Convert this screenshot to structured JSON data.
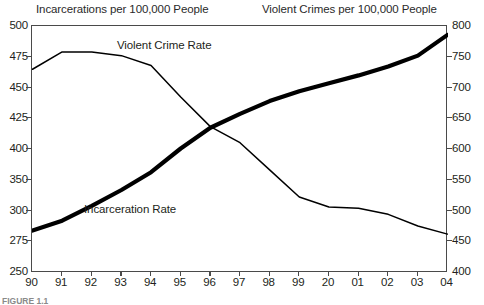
{
  "figure": {
    "left_axis_title": "Incarcerations per 100,000 People",
    "right_axis_title": "Violent Crimes per 100,000 People",
    "caption": "FIGURE 1.1"
  },
  "chart_data": {
    "type": "line",
    "title": "",
    "xlabel": "",
    "grid": false,
    "legend_position": "inline-annotations",
    "x": [
      "90",
      "91",
      "92",
      "93",
      "94",
      "95",
      "96",
      "97",
      "98",
      "99",
      "20",
      "01",
      "02",
      "03",
      "04"
    ],
    "x_tick_labels": [
      "90",
      "91",
      "92",
      "93",
      "94",
      "95",
      "96",
      "97",
      "98",
      "99",
      "20",
      "01",
      "02",
      "03",
      "04"
    ],
    "axes": [
      {
        "id": "left",
        "name": "Incarcerations per 100,000 People",
        "side": "left",
        "ylim": [
          250,
          500
        ],
        "tick_labels": [
          "500",
          "475",
          "450",
          "425",
          "400",
          "350",
          "300",
          "275",
          "250"
        ]
      },
      {
        "id": "right",
        "name": "Violent Crimes per 100,000 People",
        "side": "right",
        "ylim": [
          400,
          800
        ],
        "tick_labels": [
          "800",
          "750",
          "700",
          "650",
          "600",
          "550",
          "500",
          "450",
          "400"
        ]
      }
    ],
    "series": [
      {
        "name": "Incarceration Rate",
        "axis": "left",
        "style": "thick",
        "color": "#000000",
        "label": "Incarceration Rate",
        "values": [
          293,
          303,
          318,
          334,
          352,
          376,
          397,
          411,
          424,
          434,
          442,
          450,
          459,
          470,
          491
        ]
      },
      {
        "name": "Violent Crime Rate",
        "axis": "right",
        "style": "thin",
        "color": "#000000",
        "label": "Violent Crime Rate",
        "values": [
          730,
          758,
          758,
          752,
          736,
          685,
          637,
          611,
          567,
          523,
          507,
          505,
          495,
          476,
          463
        ]
      }
    ]
  }
}
